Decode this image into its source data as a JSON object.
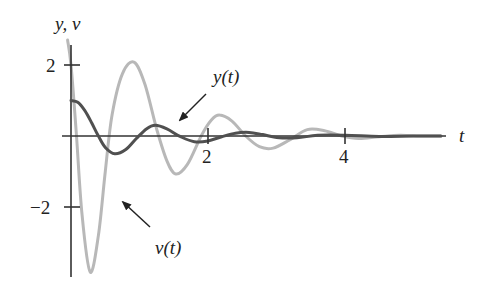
{
  "chart_data": {
    "type": "line",
    "title": "",
    "xlabel": "t",
    "ylabel": "y, v",
    "xlim": [
      0,
      5.5
    ],
    "ylim": [
      -4,
      2.6
    ],
    "x_ticks": [
      {
        "value": 2,
        "label": "2"
      },
      {
        "value": 4,
        "label": "4"
      }
    ],
    "y_ticks": [
      {
        "value": 2,
        "label": "2"
      },
      {
        "value": -2,
        "label": "−2"
      }
    ],
    "grid": false,
    "legend": "none (curves labeled with arrows)",
    "annotations": [
      {
        "text": "y(t)",
        "target_series": "y(t)"
      },
      {
        "text": "v(t)",
        "target_series": "v(t)"
      }
    ],
    "series": [
      {
        "name": "y(t)",
        "color": "#555555",
        "width": 3,
        "x": [
          0,
          0.1,
          0.2,
          0.3,
          0.4,
          0.5,
          0.64,
          0.8,
          0.95,
          1.1,
          1.23,
          1.4,
          1.6,
          1.8,
          2.0,
          2.2,
          2.4,
          2.6,
          2.8,
          3.0,
          3.3,
          3.6,
          4.0,
          4.5,
          5.0,
          5.4
        ],
        "values": [
          1.0,
          0.95,
          0.72,
          0.38,
          0.0,
          -0.32,
          -0.5,
          -0.38,
          -0.08,
          0.2,
          0.3,
          0.2,
          -0.02,
          -0.16,
          -0.14,
          -0.02,
          0.08,
          0.1,
          0.04,
          -0.04,
          -0.05,
          0.02,
          0.02,
          -0.01,
          0.0,
          0.0
        ]
      },
      {
        "name": "v(t)",
        "color": "#b5b5b5",
        "width": 3,
        "x": [
          -0.05,
          0.0,
          0.08,
          0.16,
          0.28,
          0.4,
          0.5,
          0.6,
          0.75,
          0.92,
          1.08,
          1.25,
          1.4,
          1.53,
          1.7,
          1.9,
          2.05,
          2.17,
          2.35,
          2.55,
          2.75,
          2.95,
          3.2,
          3.45,
          3.7,
          3.95,
          4.2,
          4.5,
          4.8,
          5.1,
          5.4
        ],
        "values": [
          2.7,
          2.0,
          0.0,
          -2.2,
          -3.83,
          -2.8,
          -1.0,
          0.6,
          1.75,
          2.08,
          1.45,
          0.2,
          -0.7,
          -1.07,
          -0.8,
          0.0,
          0.45,
          0.59,
          0.42,
          0.0,
          -0.3,
          -0.34,
          -0.1,
          0.18,
          0.15,
          0.0,
          -0.07,
          -0.02,
          0.02,
          0.0,
          0.0
        ]
      }
    ]
  },
  "labels": {
    "axis_y": "y, v",
    "axis_t": "t",
    "tick_y_pos": "2",
    "tick_y_neg": "−2",
    "tick_t_2": "2",
    "tick_t_4": "4",
    "curve_y": "y(t)",
    "curve_v": "v(t)"
  }
}
